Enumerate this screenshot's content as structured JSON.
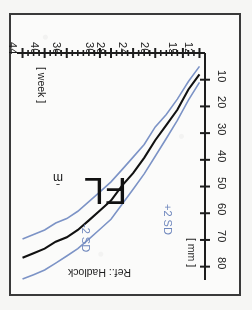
{
  "chart_data": {
    "type": "line",
    "title": "FL",
    "reference": "Ref.: Hadlock",
    "xlabel": "[ week ]",
    "ylabel": "[ mm ]",
    "xlim": [
      11,
      45
    ],
    "ylim": [
      0,
      85
    ],
    "grid": false,
    "orientation_note": "chart rendered rotated 180 degrees",
    "xticks": [
      12,
      15,
      20,
      24,
      28,
      30,
      36,
      40,
      44
    ],
    "xtick_labels": [
      "12",
      "15",
      "20",
      "24",
      "28",
      "30",
      "36",
      "40",
      "44"
    ],
    "xminor_ticks": [
      13,
      14,
      16,
      17,
      18,
      19,
      21,
      22,
      23,
      25,
      26,
      27,
      29,
      31,
      32,
      33,
      34,
      35,
      37,
      38,
      39,
      41,
      42,
      43
    ],
    "yticks": [
      10,
      20,
      30,
      40,
      50,
      60,
      70,
      80
    ],
    "ytick_labels": [
      "10",
      "20",
      "30",
      "40",
      "50",
      "60",
      "70",
      "80"
    ],
    "legend_position": "in-plot",
    "x": [
      12,
      14,
      16,
      18,
      20,
      22,
      24,
      26,
      28,
      30,
      32,
      34,
      36,
      38,
      40,
      42,
      44
    ],
    "series": [
      {
        "name": "+2 SD",
        "label": "+2 SD",
        "color": "#7c93c6",
        "values": [
          11,
          18,
          25,
          32,
          39,
          45,
          51,
          57,
          62,
          66,
          70,
          73,
          76,
          79,
          81,
          83,
          85
        ]
      },
      {
        "name": "mean",
        "label": "m̄",
        "color": "#111111",
        "values": [
          8,
          14,
          21,
          27,
          33,
          39,
          45,
          50,
          55,
          59,
          63,
          66,
          69,
          71,
          73,
          75,
          77
        ]
      },
      {
        "name": "-2 SD",
        "label": "-2 SD",
        "color": "#7c93c6",
        "values": [
          5,
          11,
          17,
          23,
          28,
          34,
          39,
          44,
          48,
          52,
          56,
          59,
          62,
          64,
          66,
          68,
          70
        ]
      }
    ]
  },
  "labels": {
    "measurement": "FL",
    "reference": "Ref.: Hadlock",
    "x_unit": "[ week ]",
    "y_unit": "[ mm ]",
    "mean_symbol": "m̄",
    "upper_sd": "+2 SD",
    "lower_sd": "-2 SD"
  },
  "colors": {
    "sd_curve": "#7c93c6",
    "mean_curve": "#111111",
    "axis": "#1d1d1d",
    "frame": "#3a3a3a",
    "background": "#fbfbfa"
  }
}
